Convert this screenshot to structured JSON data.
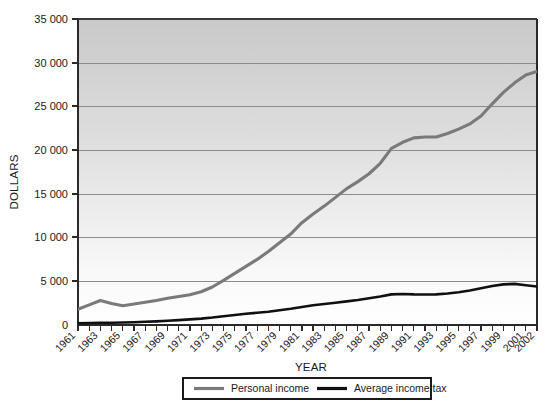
{
  "chart_data": {
    "type": "line",
    "title": "",
    "xlabel": "YEAR",
    "ylabel": "DOLLARS",
    "ylim": [
      0,
      35000
    ],
    "yticks": [
      0,
      5000,
      10000,
      15000,
      20000,
      25000,
      30000,
      35000
    ],
    "ytick_labels": [
      "0",
      "5 000",
      "10 000",
      "15 000",
      "20 000",
      "25 000",
      "30 000",
      "35 000"
    ],
    "grid": true,
    "legend_position": "bottom",
    "x": [
      1961,
      1962,
      1963,
      1964,
      1965,
      1966,
      1967,
      1968,
      1969,
      1970,
      1971,
      1972,
      1973,
      1974,
      1975,
      1976,
      1977,
      1978,
      1979,
      1980,
      1981,
      1982,
      1983,
      1984,
      1985,
      1986,
      1987,
      1988,
      1989,
      1990,
      1991,
      1992,
      1993,
      1994,
      1995,
      1996,
      1997,
      1998,
      1999,
      2000,
      2001,
      2002
    ],
    "xtick_labels": [
      "1961",
      "",
      "1963",
      "",
      "1965",
      "",
      "1967",
      "",
      "1969",
      "",
      "1971",
      "",
      "1973",
      "",
      "1975",
      "",
      "1977",
      "",
      "1979",
      "",
      "1981",
      "",
      "1983",
      "",
      "1985",
      "",
      "1987",
      "",
      "1989",
      "",
      "1991",
      "",
      "1993",
      "",
      "1995",
      "",
      "1997",
      "",
      "1999",
      "",
      "2001",
      "2002"
    ],
    "series": [
      {
        "name": "Personal income",
        "color": "#7a7a7a",
        "values": [
          1800,
          2300,
          2800,
          2450,
          2200,
          2400,
          2600,
          2800,
          3050,
          3250,
          3450,
          3800,
          4350,
          5100,
          5900,
          6700,
          7500,
          8400,
          9400,
          10400,
          11700,
          12700,
          13600,
          14600,
          15600,
          16400,
          17300,
          18500,
          20200,
          20900,
          21400,
          21500,
          21500,
          21900,
          22400,
          23000,
          23900,
          25300,
          26600,
          27700,
          28600,
          29000
        ]
      },
      {
        "name": "Average income tax",
        "color": "#101010",
        "values": [
          200,
          230,
          260,
          250,
          280,
          320,
          370,
          420,
          480,
          560,
          640,
          730,
          850,
          1000,
          1150,
          1280,
          1400,
          1520,
          1680,
          1850,
          2050,
          2250,
          2400,
          2550,
          2700,
          2850,
          3050,
          3250,
          3500,
          3550,
          3500,
          3480,
          3500,
          3600,
          3750,
          3950,
          4200,
          4450,
          4650,
          4700,
          4550,
          4400
        ]
      }
    ]
  },
  "legend": {
    "items": [
      {
        "label": "Personal income"
      },
      {
        "label": "Average income tax"
      }
    ]
  }
}
